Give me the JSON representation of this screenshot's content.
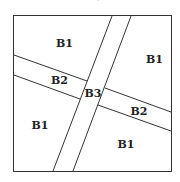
{
  "diagram": {
    "labels": [
      {
        "id": "b1-top-left",
        "text": "B1",
        "x": 56,
        "y": 47
      },
      {
        "id": "b1-top-right",
        "text": "B1",
        "x": 146,
        "y": 63
      },
      {
        "id": "b2-left",
        "text": "B2",
        "x": 51,
        "y": 84
      },
      {
        "id": "b3-center",
        "text": "B3",
        "x": 93,
        "y": 97
      },
      {
        "id": "b2-right",
        "text": "B2",
        "x": 139,
        "y": 115
      },
      {
        "id": "b1-bottom-left",
        "text": "B1",
        "x": 40,
        "y": 129
      },
      {
        "id": "b1-bottom-right",
        "text": "B1",
        "x": 126,
        "y": 148
      }
    ],
    "stroke_color": "#333333"
  }
}
